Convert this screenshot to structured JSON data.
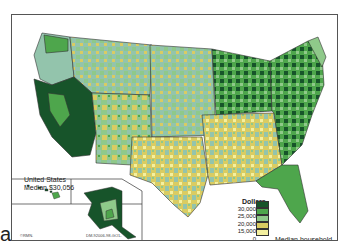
{
  "figure": {
    "panel_label": "a",
    "title": "Median household income, 1990",
    "caption_line1": "Median household",
    "caption_line2": "income, 1990"
  },
  "summary": {
    "line1": "United States",
    "line2": "Median $30,056"
  },
  "legend": {
    "unit": "Dollars",
    "ticks": [
      "30,000",
      "25,000",
      "20,000",
      "15,000",
      "0"
    ],
    "classes": [
      {
        "range": "> 30,000",
        "color": "#17542a"
      },
      {
        "range": "25,000 – 30,000",
        "color": "#4ea64c"
      },
      {
        "range": "20,000 – 25,000",
        "color": "#8fc98a"
      },
      {
        "range": "15,000 – 20,000",
        "color": "#d9cc62"
      },
      {
        "range": "0 – 15,000",
        "color": "#f4f0a0"
      }
    ]
  },
  "credits": {
    "copyright": "©RMN.",
    "code": "DM-92006-98-GO1-"
  },
  "insets": [
    "Alaska",
    "Hawaii"
  ],
  "colors": {
    "sage": "#93c4ac",
    "border": "#333333"
  }
}
